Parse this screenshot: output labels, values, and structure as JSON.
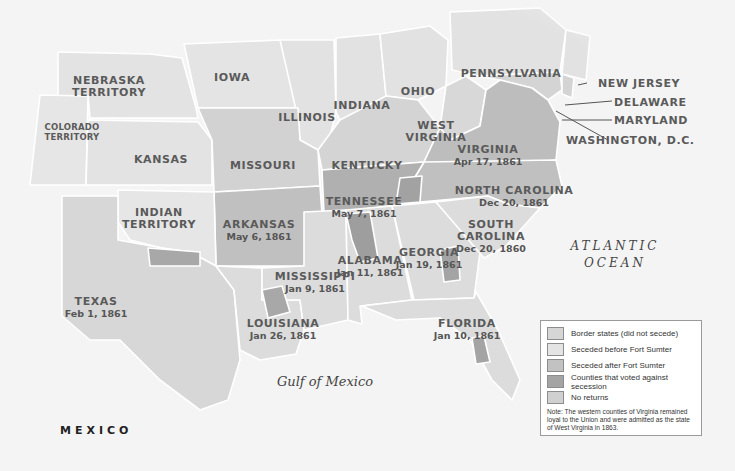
{
  "colors": {
    "background": "#f4f4f4",
    "border_states": "#d6d6d6",
    "union_states": "#e6e6e6",
    "seceded_before": "#dedede",
    "seceded_after": "#c2c2c2",
    "against_secession": "#a4a4a4",
    "no_returns": "#d0d0d0",
    "state_border": "#ffffff",
    "label": "#5a5a5a"
  },
  "labels": {
    "nebraska": "NEBRASKA",
    "nebraska2": "TERRITORY",
    "iowa": "IOWA",
    "colorado": "COLORADO",
    "colorado2": "TERRITORY",
    "kansas": "KANSAS",
    "illinois": "ILLINOIS",
    "indiana": "INDIANA",
    "ohio": "OHIO",
    "pennsylvania": "PENNSYLVANIA",
    "new_jersey": "NEW JERSEY",
    "delaware": "DELAWARE",
    "maryland": "MARYLAND",
    "washington_dc": "WASHINGTON, D.C.",
    "west_virginia": "WEST",
    "west_virginia2": "VIRGINIA",
    "missouri": "MISSOURI",
    "kentucky": "KENTUCKY",
    "indian_territory": "INDIAN",
    "indian_territory2": "TERRITORY",
    "virginia": {
      "name": "VIRGINIA",
      "date": "Apr 17, 1861"
    },
    "north_carolina": {
      "name": "NORTH CAROLINA",
      "date": "Dec 20, 1861"
    },
    "tennessee": {
      "name": "TENNESSEE",
      "date": "May 7, 1861"
    },
    "arkansas": {
      "name": "ARKANSAS",
      "date": "May 6, 1861"
    },
    "south_carolina": {
      "name": "SOUTH",
      "name2": "CAROLINA",
      "date": "Dec 20, 1860"
    },
    "georgia": {
      "name": "GEORGIA",
      "date": "Jan 19, 1861"
    },
    "alabama": {
      "name": "ALABAMA",
      "date": "Jan 11, 1861"
    },
    "mississippi": {
      "name": "MISSISSIPPI",
      "date": "Jan 9, 1861"
    },
    "texas": {
      "name": "TEXAS",
      "date": "Feb 1, 1861"
    },
    "louisiana": {
      "name": "LOUISIANA",
      "date": "Jan 26, 1861"
    },
    "florida": {
      "name": "FLORIDA",
      "date": "Jan 10, 1861"
    },
    "atlantic": "ATLANTIC",
    "ocean": "OCEAN",
    "gulf": "Gulf of Mexico",
    "mexico": "MEXICO"
  },
  "legend": {
    "items": [
      {
        "label": "Border states (did not secede)"
      },
      {
        "label": "Seceded before Fort Sumter"
      },
      {
        "label": "Seceded after Fort Sumter"
      },
      {
        "label": "Counties that voted against secession"
      },
      {
        "label": "No returns"
      }
    ],
    "note": "Note: The western counties of Virginia remained loyal to the Union and were admitted as the state of West Virginia in 1863."
  }
}
